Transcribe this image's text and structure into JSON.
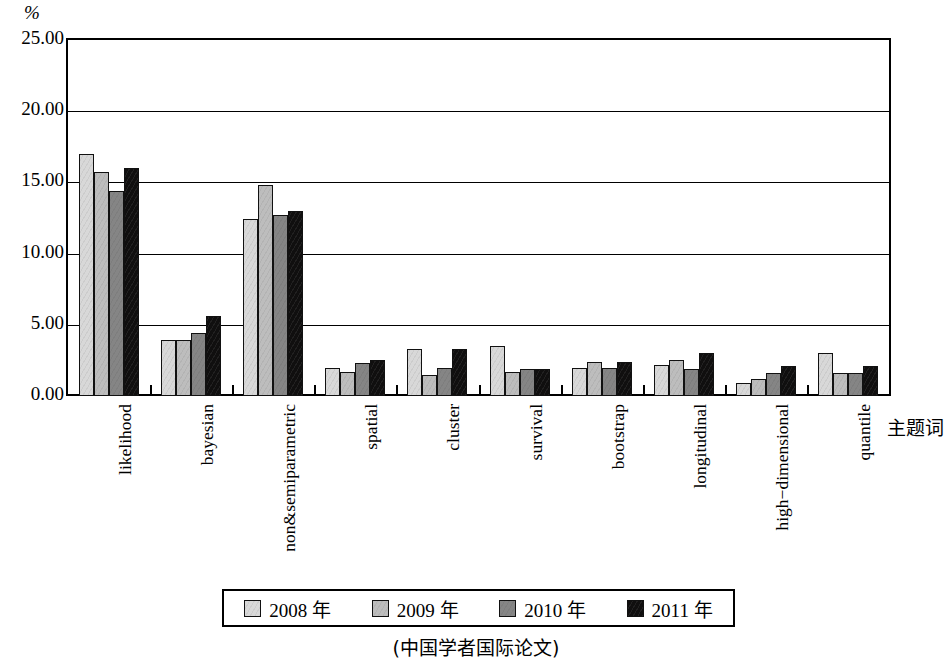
{
  "chart_data": {
    "type": "bar",
    "title": "",
    "xlabel": "主题词",
    "ylabel": "%",
    "ylim": [
      0,
      25
    ],
    "ytick_labels": [
      "0.00",
      "5.00",
      "10.00",
      "15.00",
      "20.00",
      "25.00"
    ],
    "ytick_values": [
      0,
      5,
      10,
      15,
      20,
      25
    ],
    "grid": true,
    "legend_position": "bottom",
    "caption": "(中国学者国际论文)",
    "categories": [
      "likelihood",
      "bayesian",
      "non&semiparametric",
      "spatial",
      "cluster",
      "survival",
      "bootstrap",
      "longitudinal",
      "high−dimensional",
      "quantile"
    ],
    "series": [
      {
        "name": "2008 年",
        "color": "#d8d8d8",
        "values": [
          17.0,
          3.9,
          12.4,
          2.0,
          3.3,
          3.5,
          2.0,
          2.2,
          0.9,
          3.0
        ]
      },
      {
        "name": "2009 年",
        "color": "#bdbdbd",
        "values": [
          15.7,
          3.9,
          14.8,
          1.7,
          1.5,
          1.7,
          2.4,
          2.5,
          1.2,
          1.6
        ]
      },
      {
        "name": "2010 年",
        "color": "#858585",
        "values": [
          14.4,
          4.4,
          12.7,
          2.3,
          2.0,
          1.9,
          2.0,
          1.9,
          1.6,
          1.6
        ]
      },
      {
        "name": "2011 年",
        "color": "#100f0f",
        "values": [
          16.0,
          5.6,
          13.0,
          2.5,
          3.3,
          1.9,
          2.4,
          3.0,
          2.1,
          2.1
        ]
      }
    ]
  },
  "axes": {
    "y_unit": "%",
    "x_title": "主题词"
  },
  "legend": {
    "items": [
      {
        "label": "2008 年",
        "swatch": "swatch-2008"
      },
      {
        "label": "2009 年",
        "swatch": "swatch-2009"
      },
      {
        "label": "2010 年",
        "swatch": "swatch-2010"
      },
      {
        "label": "2011 年",
        "swatch": "swatch-2011"
      }
    ]
  },
  "caption": "(中国学者国际论文)"
}
